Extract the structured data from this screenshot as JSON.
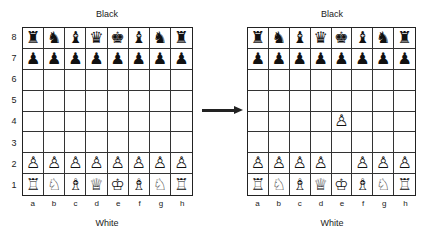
{
  "left_board": {
    "top_label": "Black",
    "bottom_label": "White",
    "ranks": [
      "8",
      "7",
      "6",
      "5",
      "4",
      "3",
      "2",
      "1"
    ],
    "files": [
      "a",
      "b",
      "c",
      "d",
      "e",
      "f",
      "g",
      "h"
    ],
    "position": [
      [
        "♜",
        "♞",
        "♝",
        "♛",
        "♚",
        "♝",
        "♞",
        "♜"
      ],
      [
        "♟",
        "♟",
        "♟",
        "♟",
        "♟",
        "♟",
        "♟",
        "♟"
      ],
      [
        "",
        "",
        "",
        "",
        "",
        "",
        "",
        ""
      ],
      [
        "",
        "",
        "",
        "",
        "",
        "",
        "",
        ""
      ],
      [
        "",
        "",
        "",
        "",
        "",
        "",
        "",
        ""
      ],
      [
        "",
        "",
        "",
        "",
        "",
        "",
        "",
        ""
      ],
      [
        "♙",
        "♙",
        "♙",
        "♙",
        "♙",
        "♙",
        "♙",
        "♙"
      ],
      [
        "♖",
        "♘",
        "♗",
        "♕",
        "♔",
        "♗",
        "♘",
        "♖"
      ]
    ]
  },
  "arrow": {
    "icon": "right-arrow-icon"
  },
  "right_board": {
    "top_label": "Black",
    "bottom_label": "White",
    "files": [
      "a",
      "b",
      "c",
      "d",
      "e",
      "f",
      "g",
      "h"
    ],
    "position": [
      [
        "♜",
        "♞",
        "♝",
        "♛",
        "♚",
        "♝",
        "♞",
        "♜"
      ],
      [
        "♟",
        "♟",
        "♟",
        "♟",
        "♟",
        "♟",
        "♟",
        "♟"
      ],
      [
        "",
        "",
        "",
        "",
        "",
        "",
        "",
        ""
      ],
      [
        "",
        "",
        "",
        "",
        "",
        "",
        "",
        ""
      ],
      [
        "",
        "",
        "",
        "",
        "♙",
        "",
        "",
        ""
      ],
      [
        "",
        "",
        "",
        "",
        "",
        "",
        "",
        ""
      ],
      [
        "♙",
        "♙",
        "♙",
        "♙",
        "",
        "♙",
        "♙",
        "♙"
      ],
      [
        "♖",
        "♘",
        "♗",
        "♕",
        "♔",
        "♗",
        "♘",
        "♖"
      ]
    ]
  }
}
